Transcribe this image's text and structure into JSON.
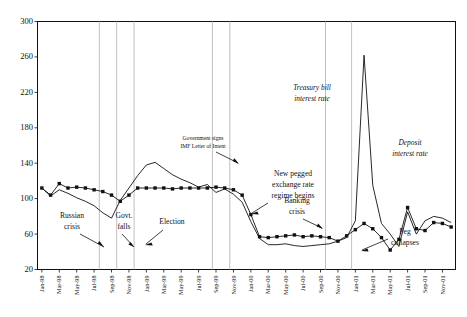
{
  "chart_data": {
    "type": "line",
    "title": "",
    "xlabel": "",
    "ylabel": "",
    "ylim": [
      20,
      300
    ],
    "yticks": [
      20,
      60,
      100,
      140,
      180,
      220,
      260,
      300
    ],
    "grid": false,
    "legend_position": "inline-annotations",
    "x": [
      "Jan-98",
      "Feb-98",
      "Mar-98",
      "Apr-98",
      "May-98",
      "Jun-98",
      "Jul-98",
      "Aug-98",
      "Sep-98",
      "Oct-98",
      "Nov-98",
      "Dec-98",
      "Jan-99",
      "Feb-99",
      "Mar-99",
      "Apr-99",
      "May-99",
      "Jun-99",
      "Jul-99",
      "Aug-99",
      "Sep-99",
      "Oct-99",
      "Nov-99",
      "Dec-99",
      "Jan-00",
      "Feb-00",
      "Mar-00",
      "Apr-00",
      "May-00",
      "Jun-00",
      "Jul-00",
      "Aug-00",
      "Sep-00",
      "Oct-00",
      "Nov-00",
      "Dec-00",
      "Jan-01",
      "Feb-01",
      "Mar-01",
      "Apr-01",
      "May-01",
      "Jun-01",
      "Jul-01",
      "Aug-01",
      "Sep-01",
      "Oct-01",
      "Nov-01",
      "Dec-01"
    ],
    "tick_labels": [
      "Jan-98",
      "Mar-98",
      "May-98",
      "Jul-98",
      "Sep-98",
      "Nov-98",
      "Jan-99",
      "Mar-99",
      "May-99",
      "Jul-99",
      "Sep-99",
      "Nov-99",
      "Jan-00",
      "Mar-00",
      "May-00",
      "Jul-00",
      "Sep-00",
      "Nov-00",
      "Jan-01",
      "Mar-01",
      "May-01",
      "Jul-01",
      "Sep-01",
      "Nov-01"
    ],
    "series": [
      {
        "name": "Treasury bill interest rate",
        "style": "line-no-marker",
        "values": [
          112,
          103,
          110,
          106,
          101,
          97,
          92,
          84,
          78,
          98,
          112,
          126,
          138,
          141,
          134,
          127,
          122,
          118,
          113,
          116,
          107,
          111,
          105,
          96,
          74,
          55,
          48,
          48,
          49,
          47,
          46,
          47,
          48,
          49,
          52,
          56,
          75,
          262,
          115,
          72,
          60,
          46,
          85,
          60,
          75,
          80,
          78,
          73
        ]
      },
      {
        "name": "Deposit interest rate",
        "style": "line-with-marker",
        "values": [
          112,
          104,
          117,
          112,
          113,
          112,
          110,
          108,
          104,
          97,
          104,
          112,
          112,
          112,
          112,
          111,
          112,
          112,
          112,
          112,
          113,
          112,
          110,
          104,
          82,
          57,
          56,
          57,
          58,
          59,
          57,
          58,
          57,
          56,
          52,
          58,
          65,
          72,
          66,
          56,
          42,
          54,
          90,
          66,
          64,
          73,
          72,
          68
        ]
      }
    ],
    "event_lines": [
      {
        "label": "Russian crisis",
        "x_index": 7
      },
      {
        "label": "Govt. falls",
        "x_index": 9
      },
      {
        "label": "Election",
        "x_index": 11
      },
      {
        "label": "Government signs IMF Letter of Intent",
        "x_index": 20
      },
      {
        "label": "New pegged exchange rate regime begins",
        "x_index": 22
      },
      {
        "label": "Banking crisis",
        "x_index": 33
      },
      {
        "label": "Peg collapses",
        "x_index": 36
      }
    ],
    "annotations": [
      {
        "name": "russian-crisis",
        "lines": [
          "Russian",
          "crisis"
        ]
      },
      {
        "name": "govt-falls",
        "lines": [
          "Govt.",
          "falls"
        ]
      },
      {
        "name": "election",
        "lines": [
          "Election"
        ]
      },
      {
        "name": "imf-letter",
        "lines": [
          "Government signs",
          "IMF Letter of Intent"
        ]
      },
      {
        "name": "pegged-regime",
        "lines": [
          "New pegged",
          "exchange rate",
          "regime begins"
        ]
      },
      {
        "name": "banking-crisis",
        "lines": [
          "Banking",
          "crisis"
        ]
      },
      {
        "name": "peg-collapses",
        "lines": [
          "Peg",
          "collapses"
        ]
      },
      {
        "name": "treasury-bill",
        "lines": [
          "Treasury bill",
          "interest rate"
        ]
      },
      {
        "name": "deposit-rate",
        "lines": [
          "Deposit",
          "interest rate"
        ]
      }
    ]
  },
  "axis": {
    "y_300": "300",
    "y_260": "260",
    "y_220": "220",
    "y_180": "180",
    "y_140": "140",
    "y_100": "100",
    "y_60": "60",
    "y_20": "20"
  },
  "labels": {
    "russian_1": "Russian",
    "russian_2": "crisis",
    "govt_1": "Govt.",
    "govt_2": "falls",
    "election_1": "Election",
    "imf_1": "Government signs",
    "imf_2": "IMF Letter of Intent",
    "peg_1": "New pegged",
    "peg_2": "exchange rate",
    "peg_3": "regime begins",
    "bank_1": "Banking",
    "bank_2": "crisis",
    "pegc_1": "Peg",
    "pegc_2": "collapses",
    "tbill_1": "Treasury bill",
    "tbill_2": "interest rate",
    "dep_1": "Deposit",
    "dep_2": "interest rate"
  }
}
